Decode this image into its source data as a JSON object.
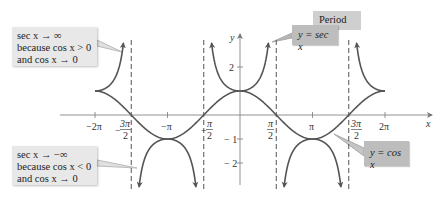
{
  "figure": {
    "axes": {
      "x_label": "x",
      "y_label": "y",
      "x_ticks": [
        "-2π",
        "-3π/2",
        "-π",
        "-π/2",
        "π/2",
        "π",
        "3π/2",
        "2π"
      ],
      "y_ticks": [
        "2",
        "1",
        "-1",
        "-2"
      ]
    },
    "curves": [
      {
        "name": "y = sec x",
        "style": "thick dark gray with arrows"
      },
      {
        "name": "y = cos x",
        "style": "thick dark gray"
      }
    ],
    "asymptotes": [
      "-3π/2",
      "-π/2",
      "π/2",
      "3π/2"
    ],
    "annotations": {
      "top_left": {
        "line1": "sec x → ∞",
        "line2": "because cos x > 0",
        "line3": "and cos x → 0"
      },
      "bottom_left": {
        "line1": "sec x → −∞",
        "line2": "because cos x < 0",
        "line3": "and cos x → 0"
      },
      "period": "Period 2π",
      "sec_label": "y = sec x",
      "cos_label": "y = cos x"
    }
  },
  "labels": {
    "x_axis": "x",
    "y_axis": "y",
    "tick_neg2pi": "−2π",
    "tick_negpi": "−π",
    "tick_pi": "π",
    "tick_2pi": "2π",
    "tick_y2": "2",
    "tick_y1": "1",
    "tick_yneg1": "− 1",
    "tick_yneg2": "− 2",
    "frac_pi": "π",
    "frac_3pi": "3π",
    "frac_den": "2",
    "minus": "−"
  },
  "colors": {
    "curve": "#555555",
    "axis": "#777777",
    "box_light": "#e8e8e8",
    "box_mid": "#bdbdbd",
    "box_dark": "#cfcfcf"
  }
}
